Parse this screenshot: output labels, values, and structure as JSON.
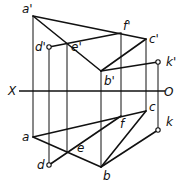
{
  "figure": {
    "type": "orthographic-projection",
    "axis": {
      "left_label": "X",
      "right_label": "O"
    },
    "labels_upper": [
      "a'",
      "d'",
      "e'",
      "f'",
      "c'",
      "b'",
      "k'"
    ],
    "labels_lower": [
      "a",
      "d",
      "e",
      "f",
      "c",
      "b",
      "k"
    ]
  }
}
